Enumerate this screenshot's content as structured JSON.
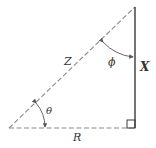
{
  "diagram": {
    "type": "right-triangle",
    "colors": {
      "stroke": "#3a3a3a",
      "dashed": "#8a8a8a",
      "text": "#333333"
    },
    "sides": {
      "hypotenuse": {
        "label": "Z",
        "style": "dashed"
      },
      "base": {
        "label": "R",
        "style": "dashed"
      },
      "vertical": {
        "label": "X",
        "style": "solid"
      }
    },
    "angles": {
      "base_angle": {
        "label": "θ"
      },
      "top_angle": {
        "label": "ϕ"
      }
    },
    "right_angle_marker": true
  }
}
